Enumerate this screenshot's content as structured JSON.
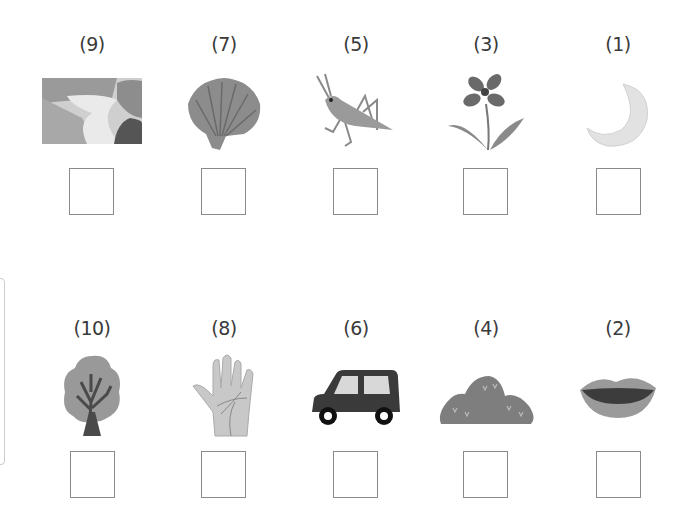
{
  "worksheet": {
    "rows": [
      {
        "items": [
          {
            "label": "(9)",
            "picture": "river-icon",
            "answer": ""
          },
          {
            "label": "(7)",
            "picture": "seashell-icon",
            "answer": ""
          },
          {
            "label": "(5)",
            "picture": "grasshopper-icon",
            "answer": ""
          },
          {
            "label": "(3)",
            "picture": "flower-icon",
            "answer": ""
          },
          {
            "label": "(1)",
            "picture": "crescent-moon-icon",
            "answer": ""
          }
        ]
      },
      {
        "items": [
          {
            "label": "(10)",
            "picture": "tree-icon",
            "answer": ""
          },
          {
            "label": "(8)",
            "picture": "hand-icon",
            "answer": ""
          },
          {
            "label": "(6)",
            "picture": "car-icon",
            "answer": ""
          },
          {
            "label": "(4)",
            "picture": "mountain-icon",
            "answer": ""
          },
          {
            "label": "(2)",
            "picture": "mouth-icon",
            "answer": ""
          }
        ]
      }
    ]
  }
}
